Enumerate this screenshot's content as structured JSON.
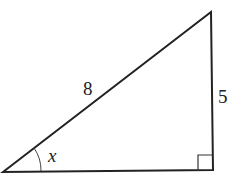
{
  "diagram": {
    "type": "right-triangle",
    "labels": {
      "hypotenuse": "8",
      "opposite": "5",
      "angle": "x"
    },
    "vertices": {
      "bottom_left": [
        3,
        172
      ],
      "top_right": [
        211,
        12
      ],
      "bottom_right": [
        213,
        170
      ]
    },
    "right_angle_marker": "bottom-right",
    "colors": {
      "stroke": "#222222",
      "background": "#ffffff"
    }
  }
}
